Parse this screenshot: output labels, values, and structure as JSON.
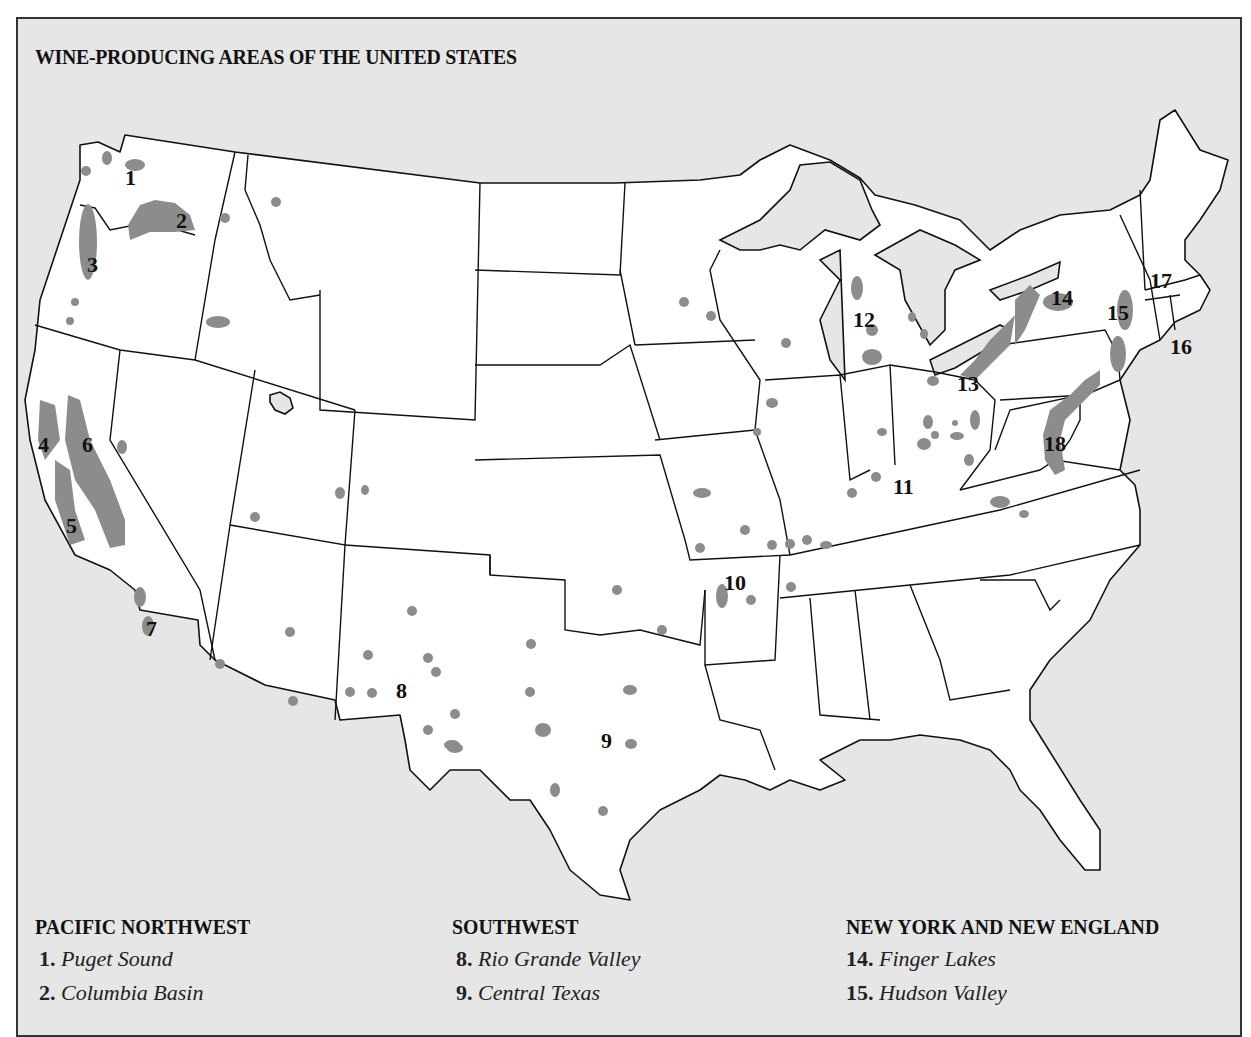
{
  "title": "WINE-PRODUCING AREAS OF THE UNITED STATES",
  "colors": {
    "background": "#e6e6e6",
    "land": "#ffffff",
    "wine_region": "#8c8c8c",
    "border": "#111111"
  },
  "map_labels": [
    {
      "id": 1,
      "x": 125,
      "y": 185
    },
    {
      "id": 2,
      "x": 176,
      "y": 228
    },
    {
      "id": 3,
      "x": 87,
      "y": 272
    },
    {
      "id": 4,
      "x": 38,
      "y": 452
    },
    {
      "id": 5,
      "x": 66,
      "y": 533
    },
    {
      "id": 6,
      "x": 82,
      "y": 452
    },
    {
      "id": 7,
      "x": 146,
      "y": 636
    },
    {
      "id": 8,
      "x": 396,
      "y": 698
    },
    {
      "id": 9,
      "x": 601,
      "y": 748
    },
    {
      "id": 10,
      "x": 724,
      "y": 590
    },
    {
      "id": 11,
      "x": 893,
      "y": 494
    },
    {
      "id": 12,
      "x": 853,
      "y": 327
    },
    {
      "id": 13,
      "x": 957,
      "y": 391
    },
    {
      "id": 14,
      "x": 1051,
      "y": 305
    },
    {
      "id": 15,
      "x": 1107,
      "y": 320
    },
    {
      "id": 16,
      "x": 1170,
      "y": 354
    },
    {
      "id": 17,
      "x": 1150,
      "y": 288
    },
    {
      "id": 18,
      "x": 1044,
      "y": 451
    }
  ],
  "legend": [
    {
      "heading": "PACIFIC NORTHWEST",
      "items": [
        {
          "num": "1.",
          "name": "Puget Sound"
        },
        {
          "num": "2.",
          "name": "Columbia Basin"
        }
      ]
    },
    {
      "heading": "SOUTHWEST",
      "items": [
        {
          "num": "8.",
          "name": "Rio Grande Valley"
        },
        {
          "num": "9.",
          "name": "Central Texas"
        }
      ]
    },
    {
      "heading": "NEW YORK AND NEW ENGLAND",
      "items": [
        {
          "num": "14.",
          "name": "Finger Lakes"
        },
        {
          "num": "15.",
          "name": "Hudson Valley"
        }
      ]
    }
  ]
}
